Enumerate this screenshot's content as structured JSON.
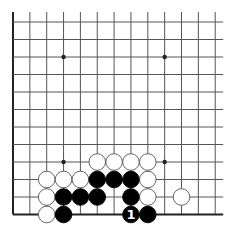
{
  "board": {
    "cols": 13,
    "rows": 12,
    "origin_x": 13,
    "origin_y": 22,
    "col_spacing": 16.85,
    "row_spacing": 17.5,
    "line_extend_right": 8,
    "line_extend_top": 10,
    "edges": {
      "left": true,
      "bottom": true,
      "top": false,
      "right": false
    },
    "colors": {
      "background": "#ffffff",
      "line": "#555555",
      "edge": "#222222",
      "black": "#000000",
      "white": "#ffffff",
      "stone_border": "#555555"
    },
    "star_points": [
      [
        3,
        2
      ],
      [
        9,
        2
      ],
      [
        3,
        8
      ],
      [
        9,
        8
      ]
    ],
    "stone_radius": 8.3
  },
  "stones": {
    "white": [
      [
        5,
        8
      ],
      [
        6,
        8
      ],
      [
        7,
        8
      ],
      [
        8,
        8
      ],
      [
        2,
        9
      ],
      [
        3,
        9
      ],
      [
        4,
        9
      ],
      [
        8,
        9
      ],
      [
        2,
        10
      ],
      [
        8,
        10
      ],
      [
        10,
        10
      ],
      [
        2,
        11
      ]
    ],
    "black": [
      [
        5,
        9
      ],
      [
        6,
        9
      ],
      [
        7,
        9
      ],
      [
        3,
        10
      ],
      [
        4,
        10
      ],
      [
        5,
        10
      ],
      [
        7,
        10
      ],
      [
        3,
        11
      ],
      [
        7,
        11
      ],
      [
        8,
        11
      ]
    ]
  },
  "labels": [
    {
      "col": 7,
      "row": 11,
      "text": "1",
      "color": "#ffffff"
    }
  ]
}
